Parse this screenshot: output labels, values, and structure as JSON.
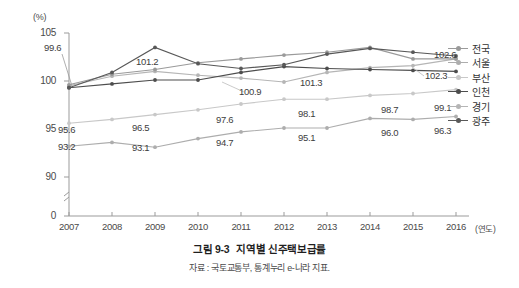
{
  "caption": {
    "figure_number": "그림 9-3",
    "title": "지역별 신주택보급률",
    "source": "자료 : 국토교통부, 통계누리 e-나라 지표."
  },
  "axes": {
    "y_unit": "(%)",
    "x_unit": "(연도)",
    "y_ticks": [
      "105",
      "100",
      "95",
      "90",
      "0"
    ],
    "x_ticks": [
      "2007",
      "2008",
      "2009",
      "2010",
      "2011",
      "2012",
      "2013",
      "2014",
      "2015",
      "2016"
    ],
    "has_axis_break": true,
    "grid": false
  },
  "legend": {
    "position": "right",
    "items": [
      {
        "label": "전국",
        "color": "#9a9a9a"
      },
      {
        "label": "서울",
        "color": "#adadad"
      },
      {
        "label": "부산",
        "color": "#c8c8c8"
      },
      {
        "label": "인천",
        "color": "#4d4d4d"
      },
      {
        "label": "경기",
        "color": "#b5b5b5"
      },
      {
        "label": "광주",
        "color": "#585858"
      }
    ]
  },
  "chart_data": {
    "type": "line",
    "title": "지역별 신주택보급률",
    "xlabel": "(연도)",
    "ylabel": "(%)",
    "ylim": [
      88.5,
      105
    ],
    "yticks": [
      90,
      95,
      100,
      105
    ],
    "x": [
      2007,
      2008,
      2009,
      2010,
      2011,
      2012,
      2013,
      2014,
      2015,
      2016
    ],
    "categories": [
      "2007",
      "2008",
      "2009",
      "2010",
      "2011",
      "2012",
      "2013",
      "2014",
      "2015",
      "2016"
    ],
    "series": [
      {
        "name": "전국",
        "color": "#9a9a9a",
        "values": [
          99.6,
          100.7,
          101.2,
          101.9,
          102.3,
          102.7,
          103.0,
          103.5,
          102.3,
          102.3
        ]
      },
      {
        "name": "서울",
        "color": "#adadad",
        "values": [
          93.2,
          93.6,
          93.1,
          94.0,
          94.7,
          95.1,
          95.1,
          96.1,
          96.0,
          96.3
        ]
      },
      {
        "name": "부산",
        "color": "#c8c8c8",
        "values": [
          95.6,
          96.0,
          96.5,
          97.0,
          97.6,
          98.1,
          98.1,
          98.5,
          98.7,
          99.1
        ]
      },
      {
        "name": "인천",
        "color": "#4d4d4d",
        "values": [
          99.3,
          99.7,
          100.1,
          100.1,
          100.9,
          101.5,
          101.3,
          101.2,
          101.1,
          101.0
        ]
      },
      {
        "name": "경기",
        "color": "#b5b5b5",
        "values": [
          99.5,
          100.5,
          101.0,
          100.6,
          100.3,
          99.9,
          100.9,
          101.4,
          101.6,
          102.3
        ]
      },
      {
        "name": "광주",
        "color": "#585858",
        "values": [
          99.3,
          100.9,
          103.5,
          101.8,
          101.3,
          101.7,
          102.8,
          103.4,
          103.0,
          102.6
        ]
      }
    ],
    "point_labels": [
      {
        "text": "99.6",
        "x": 2007,
        "value": 99.6,
        "anchor": "above-left"
      },
      {
        "text": "95.6",
        "x": 2007,
        "value": 95.6,
        "anchor": "below"
      },
      {
        "text": "93.2",
        "x": 2007,
        "value": 93.2,
        "anchor": "below"
      },
      {
        "text": "101.2",
        "x": 2009,
        "value": 101.2,
        "anchor": "below"
      },
      {
        "text": "96.5",
        "x": 2009,
        "value": 96.5,
        "anchor": "below"
      },
      {
        "text": "93.1",
        "x": 2009,
        "value": 93.1,
        "anchor": "below"
      },
      {
        "text": "100.9",
        "x": 2011,
        "value": 100.9,
        "anchor": "below"
      },
      {
        "text": "97.6",
        "x": 2011,
        "value": 97.6,
        "anchor": "below"
      },
      {
        "text": "94.7",
        "x": 2011,
        "value": 94.7,
        "anchor": "below"
      },
      {
        "text": "101.3",
        "x": 2013,
        "value": 101.3,
        "anchor": "below"
      },
      {
        "text": "98.1",
        "x": 2013,
        "value": 98.1,
        "anchor": "below"
      },
      {
        "text": "95.1",
        "x": 2013,
        "value": 95.1,
        "anchor": "below"
      },
      {
        "text": "102.3",
        "x": 2015,
        "value": 102.3,
        "anchor": "below"
      },
      {
        "text": "98.7",
        "x": 2015,
        "value": 98.7,
        "anchor": "below"
      },
      {
        "text": "96.0",
        "x": 2015,
        "value": 96.0,
        "anchor": "below"
      },
      {
        "text": "102.6",
        "x": 2016,
        "value": 102.6,
        "anchor": "below"
      },
      {
        "text": "99.1",
        "x": 2016,
        "value": 99.1,
        "anchor": "below"
      },
      {
        "text": "96.3",
        "x": 2016,
        "value": 96.3,
        "anchor": "below"
      }
    ]
  }
}
